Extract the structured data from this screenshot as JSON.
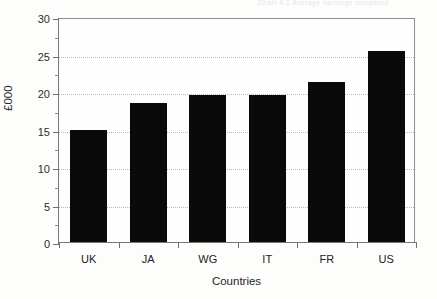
{
  "figure": {
    "cutoff_header_text": "Chart 4.1  Average earnings compared",
    "background_color": "#fdfdfc",
    "frame_color": "#8f8f8f",
    "bar_color": "#0a0a0a",
    "gridline_color": "#b9b9b9"
  },
  "chart_data": {
    "type": "bar",
    "title": "",
    "xlabel": "Countries",
    "ylabel": "£000",
    "categories": [
      "UK",
      "JA",
      "WG",
      "IT",
      "FR",
      "US"
    ],
    "values": [
      15.0,
      18.6,
      19.6,
      19.65,
      21.3,
      25.5
    ],
    "series": [
      {
        "name": "£000",
        "values": [
          15.0,
          18.6,
          19.6,
          19.65,
          21.3,
          25.5
        ]
      }
    ],
    "ylim": [
      0,
      30
    ],
    "xlim_categories": 6,
    "y_major_ticks": [
      0,
      5,
      10,
      15,
      20,
      25,
      30
    ],
    "y_tick_labels": [
      "0",
      "5",
      "10",
      "15",
      "20",
      "25",
      "30"
    ],
    "y_minor_ticks": [
      2.5,
      7.5,
      12.5,
      17.5,
      22.5,
      27.5
    ],
    "grid": "horizontal-dotted-major",
    "legend": "none",
    "legend_position": "none",
    "orientation": "vertical",
    "bar_width_fraction": 0.62
  }
}
